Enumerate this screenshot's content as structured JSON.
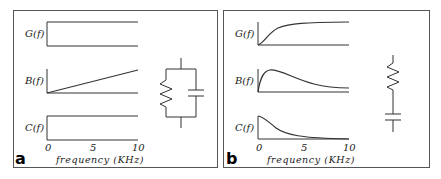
{
  "panels": [
    {
      "id": "a",
      "label": "a",
      "traces": [
        {
          "name": "G(f)",
          "shape": "constant"
        },
        {
          "name": "B(f)",
          "shape": "linear-increasing"
        },
        {
          "name": "C(f)",
          "shape": "constant"
        }
      ],
      "x_ticks": [
        "0",
        "5",
        "10"
      ],
      "x_label": "frequency (KHz)",
      "circuit": "resistor-parallel-capacitor"
    },
    {
      "id": "b",
      "label": "b",
      "traces": [
        {
          "name": "G(f)",
          "shape": "saturating-rise"
        },
        {
          "name": "B(f)",
          "shape": "peak-then-decay"
        },
        {
          "name": "C(f)",
          "shape": "decay"
        }
      ],
      "x_ticks": [
        "0",
        "5",
        "10"
      ],
      "x_label": "frequency (KHz)",
      "circuit": "resistor-series-capacitor"
    }
  ],
  "colors": {
    "line": "#333333",
    "border": "#555555"
  }
}
